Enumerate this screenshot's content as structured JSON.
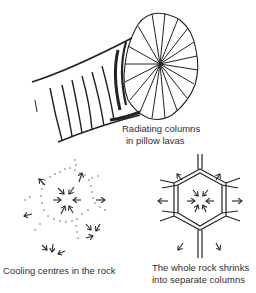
{
  "figure": {
    "panels": [
      {
        "id": "pillow-lava",
        "caption_lines": [
          "Radiating columns",
          "in pillow lavas"
        ]
      },
      {
        "id": "cooling-centres",
        "caption_lines": [
          "Cooling centres in the rock"
        ]
      },
      {
        "id": "shrinking-columns",
        "caption_lines": [
          "The whole rock shrinks",
          "into separate columns"
        ]
      }
    ],
    "ink_color": "#2a2a2a",
    "background": "#ffffff"
  }
}
